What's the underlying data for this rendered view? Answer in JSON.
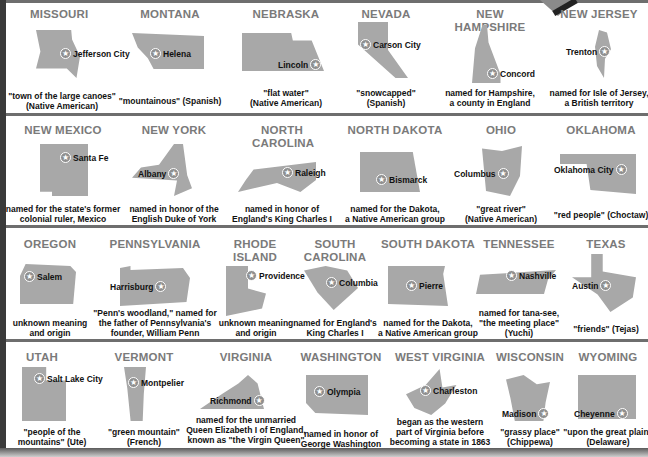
{
  "rows": [
    {
      "states": [
        {
          "name": "MISSOURI",
          "capital": "Jefferson City",
          "origin": [
            "\"town of the large canoes\"",
            "(Native American)"
          ]
        },
        {
          "name": "MONTANA",
          "capital": "Helena",
          "origin": [
            "\"mountainous\" (Spanish)"
          ]
        },
        {
          "name": "NEBRASKA",
          "capital": "Lincoln",
          "origin": [
            "\"flat water\"",
            "(Native American)"
          ]
        },
        {
          "name": "NEVADA",
          "capital": "Carson City",
          "origin": [
            "\"snowcapped\"",
            "(Spanish)"
          ]
        },
        {
          "name": "NEW HAMPSHIRE",
          "capital": "Concord",
          "origin": [
            "named for Hampshire,",
            "a county in England"
          ]
        },
        {
          "name": "NEW JERSEY",
          "capital": "Trenton",
          "origin": [
            "named for Isle of Jersey,",
            "a British territory"
          ]
        }
      ]
    },
    {
      "states": [
        {
          "name": "NEW MEXICO",
          "capital": "Santa Fe",
          "origin": [
            "named for the state's former",
            "colonial ruler, Mexico"
          ]
        },
        {
          "name": "NEW YORK",
          "capital": "Albany",
          "origin": [
            "named in honor of the",
            "English Duke of York"
          ]
        },
        {
          "name": "NORTH CAROLINA",
          "capital": "Raleigh",
          "origin": [
            "named in honor of",
            "England's King Charles I"
          ]
        },
        {
          "name": "NORTH DAKOTA",
          "capital": "Bismarck",
          "origin": [
            "named for the Dakota,",
            "a Native American group"
          ]
        },
        {
          "name": "OHIO",
          "capital": "Columbus",
          "origin": [
            "\"great river\"",
            "(Native American)"
          ]
        },
        {
          "name": "OKLAHOMA",
          "capital": "Oklahoma City",
          "origin": [
            "\"red people\" (Choctaw)"
          ]
        }
      ]
    },
    {
      "states": [
        {
          "name": "OREGON",
          "capital": "Salem",
          "origin": [
            "unknown meaning",
            "and origin"
          ]
        },
        {
          "name": "PENNSYLVANIA",
          "capital": "Harrisburg",
          "origin": [
            "\"Penn's woodland,\" named for",
            "the father of Pennsylvania's",
            "founder, William Penn"
          ]
        },
        {
          "name": "RHODE ISLAND",
          "capital": "Providence",
          "origin": [
            "unknown meaning",
            "and origin"
          ]
        },
        {
          "name": "SOUTH CAROLINA",
          "capital": "Columbia",
          "origin": [
            "named for England's",
            "King Charles I"
          ]
        },
        {
          "name": "SOUTH DAKOTA",
          "capital": "Pierre",
          "origin": [
            "named for the Dakota,",
            "a Native American group"
          ]
        },
        {
          "name": "TENNESSEE",
          "capital": "Nashville",
          "origin": [
            "named for tana-see,",
            "\"the meeting place\"",
            "(Yuchi)"
          ]
        },
        {
          "name": "TEXAS",
          "capital": "Austin",
          "origin": [
            "\"friends\" (Tejas)"
          ]
        }
      ]
    },
    {
      "states": [
        {
          "name": "UTAH",
          "capital": "Salt Lake City",
          "origin": [
            "\"people of the",
            "mountains\" (Ute)"
          ]
        },
        {
          "name": "VERMONT",
          "capital": "Montpelier",
          "origin": [
            "\"green mountain\"",
            "(French)"
          ]
        },
        {
          "name": "VIRGINIA",
          "capital": "Richmond",
          "origin": [
            "named for the unmarried",
            "Queen Elizabeth I of England,",
            "known as \"the Virgin Queen\""
          ]
        },
        {
          "name": "WASHINGTON",
          "capital": "Olympia",
          "origin": [
            "named in honor of",
            "George Washington"
          ]
        },
        {
          "name": "WEST VIRGINIA",
          "capital": "Charleston",
          "origin": [
            "began as the western",
            "part of Virginia before",
            "becoming a state in 1863"
          ]
        },
        {
          "name": "WISCONSIN",
          "capital": "Madison",
          "origin": [
            "\"grassy place\"",
            "(Chippewa)"
          ]
        },
        {
          "name": "WYOMING",
          "capital": "Cheyenne",
          "origin": [
            "\"upon the great plain\"",
            "(Delaware)"
          ]
        }
      ]
    }
  ],
  "colors": {
    "heading": "#7a7a7a",
    "shape": "#a8a8a8",
    "separator": "#6e6e6e",
    "border": "#3a3a3a"
  },
  "icons": {
    "capital_marker": "star-icon"
  }
}
